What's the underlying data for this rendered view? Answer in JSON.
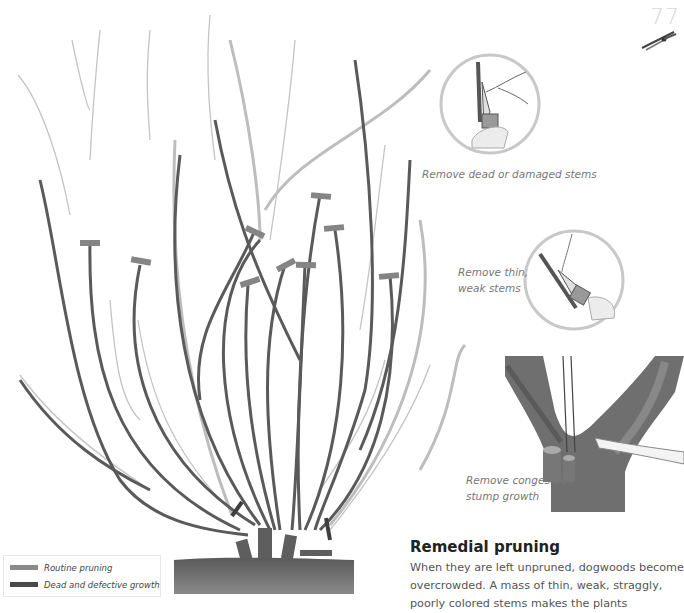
{
  "page": {
    "number": "77"
  },
  "illustrations": {
    "shrub": {
      "description": "Overgrown dogwood shrub with pruning cut markers"
    },
    "insets": [
      {
        "id": "dead-stems",
        "caption": "Remove dead or damaged stems"
      },
      {
        "id": "thin-stems",
        "caption_line1": "Remove thin,",
        "caption_line2": "weak stems"
      },
      {
        "id": "stump-growth",
        "caption_line1": "Remove congested",
        "caption_line2": "stump growth"
      }
    ]
  },
  "legend": {
    "items": [
      {
        "label": "Routine pruning",
        "color": "#8a8a8a"
      },
      {
        "label": "Dead and defective growth",
        "color": "#4a4a4a"
      }
    ]
  },
  "section": {
    "title": "Remedial pruning",
    "body": "When they are left unpruned, dogwoods become overcrowded. A mass of thin, weak, straggly, poorly colored stems makes the plants"
  },
  "colors": {
    "stem_dark": "#5a5a5a",
    "stem_light": "#bdbdbd",
    "marker_routine": "#8a8a8a",
    "marker_dead": "#4a4a4a",
    "soil": "#6a6a6a"
  }
}
